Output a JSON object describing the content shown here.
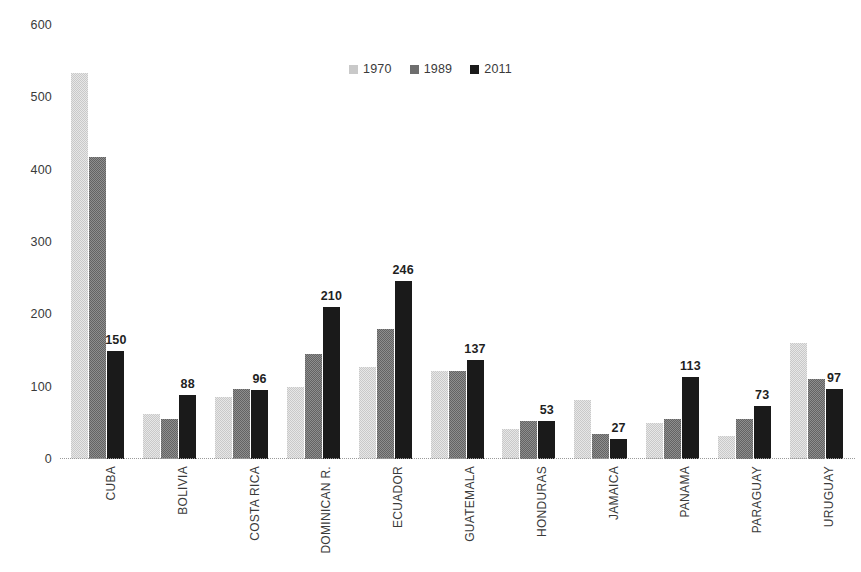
{
  "chart_data": {
    "type": "bar",
    "title": "",
    "subtitle": "",
    "xlabel": "",
    "ylabel": "",
    "ylim": [
      0,
      600
    ],
    "yticks": [
      0,
      100,
      200,
      300,
      400,
      500,
      600
    ],
    "grid": false,
    "legend_position": "top-center",
    "legend": [
      "1970",
      "1989",
      "2011"
    ],
    "categories": [
      "CUBA",
      "BOLIVIA",
      "COSTA RICA",
      "DOMINICAN R.",
      "ECUADOR",
      "GUATEMALA",
      "HONDURAS",
      "JAMAICA",
      "PANAMA",
      "PARAGUAY",
      "URUGUAY"
    ],
    "series": [
      {
        "name": "1970",
        "color": "#c9c9c9",
        "values": [
          533,
          62,
          86,
          100,
          127,
          122,
          42,
          82,
          50,
          32,
          160
        ]
      },
      {
        "name": "1989",
        "color": "#636363",
        "values": [
          417,
          55,
          97,
          145,
          180,
          122,
          52,
          35,
          55,
          55,
          110
        ]
      },
      {
        "name": "2011",
        "color": "#1a1a1a",
        "values": [
          150,
          88,
          96,
          210,
          246,
          137,
          53,
          27,
          113,
          73,
          97
        ]
      }
    ],
    "data_labels": {
      "series": "2011",
      "values": [
        150,
        88,
        96,
        210,
        246,
        137,
        53,
        27,
        113,
        73,
        97
      ]
    }
  }
}
